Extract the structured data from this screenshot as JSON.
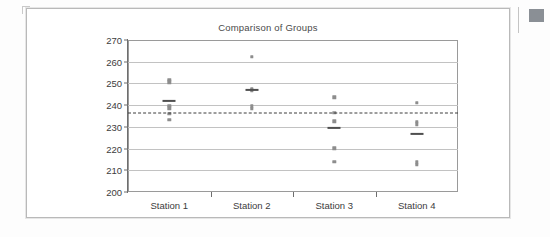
{
  "chart_data": {
    "type": "scatter",
    "title": "Comparison of Groups",
    "xlabel": "",
    "ylabel": "",
    "ylim": [
      200,
      270
    ],
    "yticks": [
      200,
      210,
      220,
      230,
      240,
      250,
      260,
      270
    ],
    "ytick_labels": [
      "200",
      "210",
      "220",
      "230",
      "240",
      "250",
      "260",
      "270"
    ],
    "categories": [
      "Station 1",
      "Station 2",
      "Station 3",
      "Station 4"
    ],
    "grid": true,
    "legend": "none",
    "grand_mean": 236.5,
    "grand_mean_style": "dashed",
    "groups": [
      {
        "name": "Station 1",
        "values": [
          251.8,
          250.6,
          239.6,
          238.6,
          236.0,
          233.2
        ],
        "group_mean": 242.0
      },
      {
        "name": "Station 2",
        "values": [
          262.2,
          247.4,
          247.0,
          246.6,
          239.4,
          238.4
        ],
        "group_mean": 247.0
      },
      {
        "name": "Station 3",
        "values": [
          243.6,
          236.4,
          232.6,
          220.2,
          213.8
        ],
        "group_mean": 229.4
      },
      {
        "name": "Station 4",
        "values": [
          241.2,
          232.4,
          231.2,
          213.6,
          212.6
        ],
        "group_mean": 226.8
      }
    ]
  },
  "colors": {
    "dot": "#8d8d8d",
    "mean_mark": "#4f4f4f",
    "grand_mean": "#3d3d3d",
    "grid": "#c2c2c2",
    "axis": "#6e6e6e",
    "side_block": "#8a8f95"
  },
  "side_marker": {
    "label": "page-edge-marker"
  }
}
